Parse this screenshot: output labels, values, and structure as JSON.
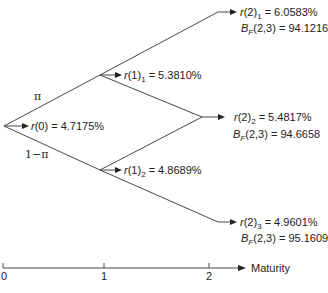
{
  "tree": {
    "root": {
      "rate_label": "r(0) = 4.7175%",
      "var": "r",
      "args": "(0)",
      "value": "= 4.7175%"
    },
    "prob_up": "π",
    "prob_down": "1−π",
    "t1": [
      {
        "var": "r",
        "args": "(1)",
        "sub": "1",
        "value": "= 5.3810%"
      },
      {
        "var": "r",
        "args": "(1)",
        "sub": "2",
        "value": "= 4.8689%"
      }
    ],
    "t2": [
      {
        "var": "r",
        "args": "(2)",
        "sub": "1",
        "value": "= 6.0583%",
        "bond_var": "B",
        "bond_sub": "F",
        "bond_args": "(2,3)",
        "bond_value": "= 94.1216"
      },
      {
        "var": "r",
        "args": "(2)",
        "sub": "2",
        "value": "= 5.4817%",
        "bond_var": "B",
        "bond_sub": "F",
        "bond_args": "(2,3)",
        "bond_value": "= 94.6658"
      },
      {
        "var": "r",
        "args": "(2)",
        "sub": "3",
        "value": "= 4.9601%",
        "bond_var": "B",
        "bond_sub": "F",
        "bond_args": "(2,3)",
        "bond_value": "= 95.1609"
      }
    ]
  },
  "axis": {
    "ticks": [
      "0",
      "1",
      "2"
    ],
    "label": "Maturity"
  }
}
